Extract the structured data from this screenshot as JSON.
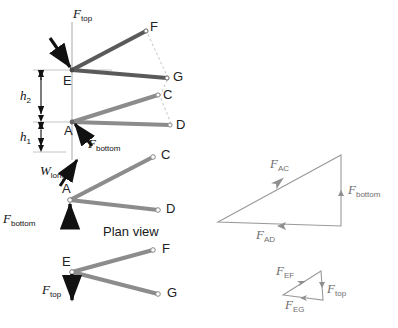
{
  "figure": {
    "background": "#ffffff",
    "colors": {
      "arm_upper": "#5a5a5a",
      "arm_lower": "#8c8c8c",
      "plan_arm": "#8c8c8c",
      "construction": "#c9c9c9",
      "arrow_black": "#111111",
      "triangle_line": "#9a9a9a",
      "text": "#1a1a1a"
    }
  },
  "elevation_view": {
    "nodes": [
      {
        "id": "E",
        "label": "E",
        "x": 72,
        "y": 70
      },
      {
        "id": "A",
        "label": "A",
        "x": 72,
        "y": 122
      },
      {
        "id": "F",
        "label": "F",
        "x": 146,
        "y": 30
      },
      {
        "id": "G",
        "label": "G",
        "x": 168,
        "y": 78
      },
      {
        "id": "C",
        "label": "C",
        "x": 160,
        "y": 96
      },
      {
        "id": "D",
        "label": "D",
        "x": 172,
        "y": 126
      }
    ],
    "members": [
      {
        "from": "E",
        "to": "F",
        "shade": "dark"
      },
      {
        "from": "E",
        "to": "G",
        "shade": "dark"
      },
      {
        "from": "A",
        "to": "C",
        "shade": "light"
      },
      {
        "from": "A",
        "to": "D",
        "shade": "light"
      }
    ],
    "construction_lines": [
      {
        "from": "F",
        "to": "G"
      },
      {
        "from": "G",
        "to": "C"
      },
      {
        "from": "C",
        "to": "D"
      }
    ],
    "dimensions": [
      {
        "id": "h2",
        "label": "h",
        "subscript": "2",
        "from_y": 70,
        "to_y": 122,
        "x": 41
      },
      {
        "id": "h1",
        "label": "h",
        "subscript": "1",
        "from_y": 122,
        "to_y": 152,
        "x": 41
      }
    ],
    "forces": [
      {
        "id": "F_top",
        "label": "F",
        "subscript": "top",
        "label_x": 76,
        "label_y": 10,
        "direction": "down-right-into-E"
      },
      {
        "id": "F_bottom",
        "label": "F",
        "subscript": "bottom",
        "label_x": 88,
        "label_y": 140,
        "direction": "up-left-into-A"
      },
      {
        "id": "W_long",
        "label": "W",
        "subscript": "long",
        "label_x": 42,
        "label_y": 166,
        "direction": "up-right-into-A"
      }
    ]
  },
  "plan_view": {
    "caption": "Plan view",
    "caption_x": 103,
    "caption_y": 226,
    "upper_group": {
      "nodes": [
        {
          "id": "A",
          "label": "A",
          "x": 70,
          "y": 200
        },
        {
          "id": "C",
          "label": "C",
          "x": 155,
          "y": 157
        },
        {
          "id": "D",
          "label": "D",
          "x": 160,
          "y": 210
        }
      ],
      "members": [
        {
          "from": "A",
          "to": "C"
        },
        {
          "from": "A",
          "to": "D"
        }
      ],
      "force": {
        "id": "F_bottom",
        "label": "F",
        "subscript": "bottom",
        "label_x": 4,
        "label_y": 215,
        "direction": "up-into-A"
      }
    },
    "lower_group": {
      "nodes": [
        {
          "id": "E",
          "label": "E",
          "x": 72,
          "y": 272
        },
        {
          "id": "F",
          "label": "F",
          "x": 155,
          "y": 250
        },
        {
          "id": "G",
          "label": "G",
          "x": 160,
          "y": 294
        }
      ],
      "members": [
        {
          "from": "E",
          "to": "F"
        },
        {
          "from": "E",
          "to": "G"
        }
      ],
      "force": {
        "id": "F_top",
        "label": "F",
        "subscript": "top",
        "label_x": 44,
        "label_y": 288,
        "direction": "down-from-E"
      }
    }
  },
  "force_triangle_bottom": {
    "vertices": [
      {
        "x": 218,
        "y": 222
      },
      {
        "x": 341,
        "y": 155
      },
      {
        "x": 341,
        "y": 226
      }
    ],
    "edges": [
      {
        "id": "F_AC",
        "label": "F",
        "subscript": "AC",
        "label_x": 272,
        "label_y": 160,
        "arrow": "toward-upper-right"
      },
      {
        "id": "F_bottom",
        "label": "F",
        "subscript": "bottom",
        "label_x": 348,
        "label_y": 185,
        "arrow": "upward"
      },
      {
        "id": "F_AD",
        "label": "F",
        "subscript": "AD",
        "label_x": 258,
        "label_y": 228,
        "arrow": "toward-left"
      }
    ]
  },
  "force_triangle_top": {
    "vertices": [
      {
        "x": 283,
        "y": 295
      },
      {
        "x": 321,
        "y": 271
      },
      {
        "x": 323,
        "y": 300
      }
    ],
    "edges": [
      {
        "id": "F_EF",
        "label": "F",
        "subscript": "EF",
        "label_x": 278,
        "label_y": 267,
        "arrow": "toward-upper-right"
      },
      {
        "id": "F_top",
        "label": "F",
        "subscript": "top",
        "label_x": 328,
        "label_y": 284,
        "arrow": "downward"
      },
      {
        "id": "F_EG",
        "label": "F",
        "subscript": "EG",
        "label_x": 288,
        "label_y": 300,
        "arrow": "toward-left"
      }
    ]
  }
}
